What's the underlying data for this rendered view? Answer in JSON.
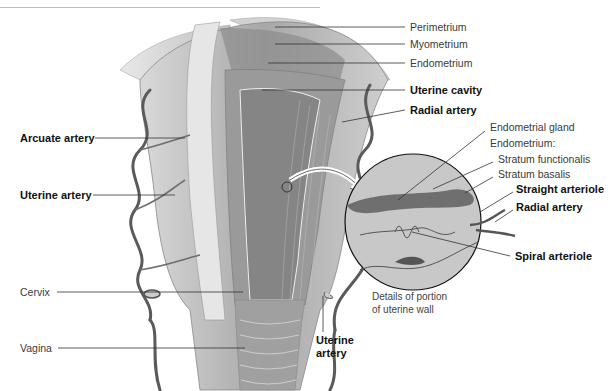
{
  "figure": {
    "caption_lines": [
      "Details of portion",
      "of uterine wall"
    ],
    "labels_right": [
      {
        "text": "Perimetrium",
        "bold": false
      },
      {
        "text": "Myometrium",
        "bold": false
      },
      {
        "text": "Endometrium",
        "bold": false
      },
      {
        "text": "Uterine cavity",
        "bold": true
      },
      {
        "text": "Radial artery",
        "bold": true
      }
    ],
    "labels_detail": [
      {
        "text": "Endometrial gland",
        "bold": false
      },
      {
        "text": "Endometrium:",
        "bold": false
      },
      {
        "text": "Stratum functionalis",
        "bold": false
      },
      {
        "text": "Stratum basalis",
        "bold": false
      },
      {
        "text": "Straight arteriole",
        "bold": true
      },
      {
        "text": "Radial artery",
        "bold": true
      },
      {
        "text": "Spiral arteriole",
        "bold": true
      }
    ],
    "labels_left": [
      {
        "text": "Arcuate artery",
        "bold": true
      },
      {
        "text": "Uterine artery",
        "bold": true
      },
      {
        "text": "Cervix",
        "bold": false
      },
      {
        "text": "Vagina",
        "bold": false
      }
    ],
    "label_lower_right": {
      "line1": "Uterine",
      "line2": "artery",
      "bold": true
    }
  }
}
